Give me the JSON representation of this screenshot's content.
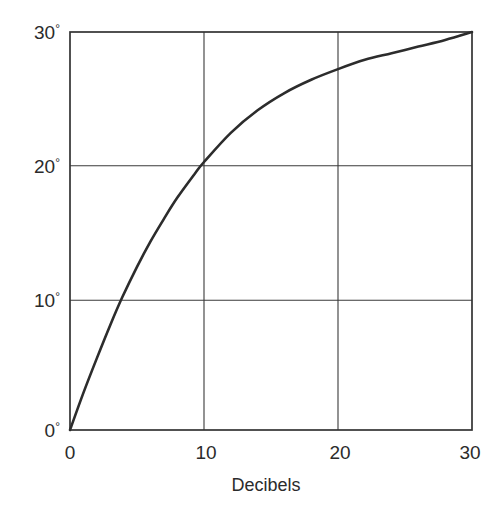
{
  "chart_data": {
    "type": "line",
    "title": "",
    "subtitle": "",
    "xlabel": "Decibels",
    "ylabel": "",
    "xlim": [
      0,
      30
    ],
    "ylim": [
      0,
      30
    ],
    "grid": true,
    "legend": null,
    "x_ticks": [
      0,
      10,
      20,
      30
    ],
    "x_tick_labels": [
      "0",
      "10",
      "20",
      "30"
    ],
    "y_ticks": [
      0,
      10,
      20,
      30
    ],
    "y_tick_labels": [
      "0°",
      "10°",
      "20°",
      "30°"
    ],
    "y_tick_numbers": [
      "0",
      "10",
      "20",
      "30"
    ],
    "degree_symbol": "°",
    "series": [
      {
        "name": "phase",
        "x": [
          0,
          1,
          2,
          3,
          3.9,
          5,
          6,
          7,
          8,
          9.3,
          10,
          12,
          14,
          16,
          18,
          20,
          22,
          24,
          26,
          28,
          30
        ],
        "y": [
          0,
          2.8,
          5.4,
          7.9,
          10.0,
          12.3,
          14.2,
          15.9,
          17.5,
          19.3,
          20.2,
          22.4,
          24.1,
          25.4,
          26.4,
          27.2,
          27.9,
          28.4,
          28.9,
          29.4,
          30.0
        ]
      }
    ],
    "annotations": [],
    "colors": {
      "curve": "#2c2c2c",
      "grid": "#3a3a3a",
      "frame": "#333333",
      "text": "#2b2b2b",
      "background": "#ffffff"
    }
  },
  "axis_labels": {
    "x_title": "Decibels"
  }
}
